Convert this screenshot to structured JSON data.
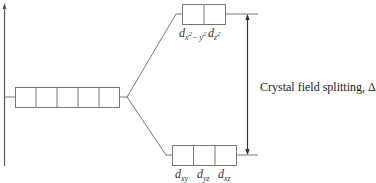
{
  "diagram": {
    "caption": "Crystal field splitting, Δ",
    "degenerate_level": {
      "orbital_count": 5
    },
    "upper_level": {
      "orbital_count": 2,
      "labels": [
        {
          "base": "d",
          "sub": "x",
          "sup": "2",
          "sub2": "− y",
          "sup2": "2",
          "text": "dx²−y²"
        },
        {
          "base": "d",
          "sub": "z",
          "sup": "2",
          "text": "dz²"
        }
      ]
    },
    "lower_level": {
      "orbital_count": 3,
      "labels": [
        {
          "base": "d",
          "sub": "xy",
          "text": "dxy"
        },
        {
          "base": "d",
          "sub": "yz",
          "text": "dyz"
        },
        {
          "base": "d",
          "sub": "xz",
          "text": "dxz"
        }
      ]
    },
    "colors": {
      "line": "#555555",
      "text": "#222222"
    }
  }
}
